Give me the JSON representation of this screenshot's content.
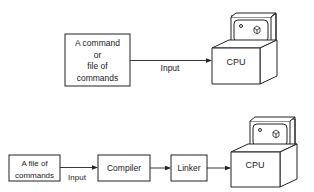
{
  "top_diagram": {
    "source_box": {
      "lines": [
        "A command",
        "or",
        "file of",
        "commands"
      ]
    },
    "arrow_label": "Input",
    "cpu_label": "CPU"
  },
  "bottom_diagram": {
    "source_box": {
      "lines": [
        "A file of",
        "commands"
      ]
    },
    "arrow_label": "Input",
    "compiler_label": "Compiler",
    "linker_label": "Linker",
    "cpu_label": "CPU"
  },
  "colors": {
    "stroke": "#222222",
    "background": "#ffffff"
  }
}
